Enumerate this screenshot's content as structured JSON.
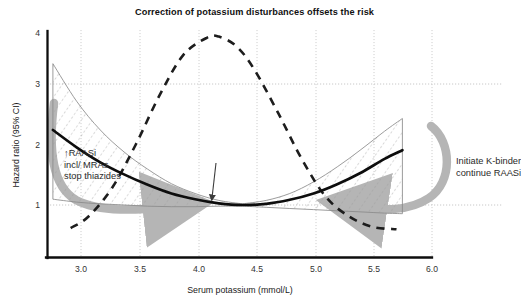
{
  "chart_data": {
    "type": "line",
    "title": "Correction of potassium disturbances offsets the risk",
    "xlabel": "Serum potassium (mmol/L)",
    "ylabel": "Hazard ratio (95% CI)",
    "xlim": [
      2.75,
      6.0
    ],
    "ylim": [
      0.55,
      4.0
    ],
    "xticks": [
      "3.0",
      "3.5",
      "4.0",
      "4.5",
      "5.0",
      "5.5",
      "6.0"
    ],
    "xtick_values": [
      3.0,
      3.5,
      4.0,
      4.5,
      5.0,
      5.5,
      6.0
    ],
    "yticks": [
      "1",
      "2",
      "3",
      "4"
    ],
    "ytick_values": [
      1,
      2,
      3,
      4
    ],
    "grid": "dotted gridlines at every x tick and at y = 1 and y = 3",
    "legend": "none",
    "reference_line": 1,
    "series": [
      {
        "name": "Hazard ratio (point estimate)",
        "style": "thick solid black U-shaped curve",
        "x": [
          2.8,
          3.0,
          3.2,
          3.4,
          3.6,
          3.8,
          4.0,
          4.2,
          4.4,
          4.6,
          4.8,
          5.0,
          5.2,
          5.4,
          5.6,
          5.75
        ],
        "values": [
          2.3,
          2.0,
          1.74,
          1.53,
          1.35,
          1.2,
          1.1,
          1.03,
          1.0,
          1.02,
          1.09,
          1.2,
          1.36,
          1.56,
          1.8,
          1.95
        ]
      },
      {
        "name": "95% CI upper bound",
        "style": "thin solid grey line, hatched fill to lower bound",
        "x": [
          2.8,
          3.0,
          3.2,
          3.4,
          3.6,
          3.8,
          4.0,
          4.2,
          4.4,
          4.6,
          4.8,
          5.0,
          5.2,
          5.4,
          5.6,
          5.75
        ],
        "values": [
          3.45,
          2.8,
          2.3,
          1.92,
          1.62,
          1.37,
          1.2,
          1.08,
          1.02,
          1.08,
          1.2,
          1.4,
          1.66,
          1.96,
          2.28,
          2.5
        ]
      },
      {
        "name": "95% CI lower bound",
        "style": "thin solid grey line, hatched fill to upper bound",
        "x": [
          2.8,
          3.0,
          3.2,
          3.4,
          3.6,
          3.8,
          4.0,
          4.2,
          4.4,
          4.6,
          4.8,
          5.0,
          5.2,
          5.4,
          5.6,
          5.75
        ],
        "values": [
          1.1,
          1.05,
          1.02,
          1.0,
          0.98,
          0.97,
          0.97,
          0.98,
          0.98,
          0.96,
          0.94,
          0.92,
          0.9,
          0.88,
          0.86,
          0.85
        ]
      },
      {
        "name": "Population distribution of serum potassium",
        "style": "thick black dashed bell curve",
        "x": [
          2.95,
          3.1,
          3.3,
          3.5,
          3.7,
          3.9,
          4.1,
          4.2,
          4.35,
          4.5,
          4.7,
          4.9,
          5.1,
          5.3,
          5.5,
          5.7
        ],
        "values": [
          0.6,
          0.8,
          1.3,
          2.05,
          2.9,
          3.6,
          3.9,
          3.92,
          3.75,
          3.35,
          2.6,
          1.8,
          1.15,
          0.8,
          0.62,
          0.58
        ]
      }
    ],
    "annotations": [
      {
        "name": "hypokalaemia-action",
        "text": "↑RAASi\nincl/ MRAs\nstop thiazides",
        "position": "left, near serum potassium 3.0-3.6, hazard ratio ~1.3-1.7"
      },
      {
        "name": "hyperkalaemia-action",
        "text": "Initiate K-binder\ncontinue RAASi",
        "position": "right, outside plot near serum potassium 6.0, hazard ratio ~1.5"
      }
    ],
    "arrows": [
      {
        "name": "left-correction-arrow",
        "color": "#b3b3b3",
        "description": "thick grey curved arrow sweeping from high hazard ratio at low potassium down toward hazard ratio 1"
      },
      {
        "name": "right-correction-arrow",
        "color": "#b3b3b3",
        "description": "thick grey curved arrow sweeping from high hazard ratio at high potassium down toward hazard ratio 1"
      },
      {
        "name": "nadir-arrow",
        "color": "#3c3c3c",
        "description": "small arrow pointing at the curve nadir near serum potassium 4.4"
      }
    ]
  },
  "colors": {
    "axis": "#111111",
    "curve": "#111111",
    "ci_line": "#8a8a8a",
    "hatch": "#9a9a9a",
    "grid": "#c8c8c8",
    "grey_arrow": "#b5b5b5",
    "text": "#1a1a1a"
  }
}
